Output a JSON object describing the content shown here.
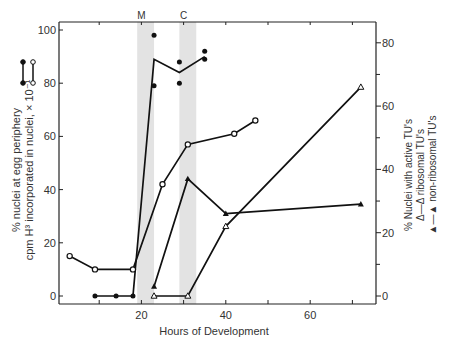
{
  "chart_data": {
    "type": "line",
    "title": "",
    "xlabel": "Hours of Development",
    "ylabel_left": [
      "% nuclei at egg periphery",
      "cpm H³ incorporated in nuclei, × 10⁻¹"
    ],
    "ylabel_right": [
      "% Nuclei with active TU's",
      "Δ—Δ ribosomal TU's",
      "▲—▲ non-ribosomal TU's"
    ],
    "xlim": [
      0,
      75
    ],
    "ylim_left": [
      0,
      100
    ],
    "ylim_right": [
      0,
      85
    ],
    "x_ticks": [
      20,
      40,
      60
    ],
    "y_ticks_left": [
      0,
      20,
      40,
      60,
      80,
      100
    ],
    "y_ticks_right": [
      0,
      20,
      40,
      60,
      80
    ],
    "grid": false,
    "annotations": [
      {
        "label": "M",
        "x": 20,
        "band": [
          19,
          23
        ]
      },
      {
        "label": "C",
        "x": 30,
        "band": [
          29,
          33
        ]
      }
    ],
    "series": [
      {
        "name": "% nuclei at egg periphery",
        "marker": "filled-circle",
        "axis": "left",
        "x": [
          9,
          14,
          18,
          23,
          29,
          35
        ],
        "values": [
          0,
          0,
          0,
          89,
          84,
          90
        ],
        "scatter_points": [
          [
            23,
            98
          ],
          [
            23,
            79
          ],
          [
            29,
            88
          ],
          [
            29,
            80
          ],
          [
            35,
            92
          ],
          [
            35,
            89
          ]
        ]
      },
      {
        "name": "cpm H³ incorporated in nuclei, × 10⁻¹",
        "marker": "open-circle",
        "axis": "left",
        "x": [
          3,
          9,
          18,
          25,
          31,
          42,
          47
        ],
        "values": [
          15,
          10,
          10,
          42,
          57,
          61,
          66
        ]
      },
      {
        "name": "ribosomal TU's",
        "marker": "open-triangle",
        "axis": "right",
        "x": [
          23,
          31,
          40,
          72
        ],
        "values": [
          0,
          0,
          22,
          66
        ]
      },
      {
        "name": "non-ribosomal TU's",
        "marker": "filled-triangle",
        "axis": "right",
        "x": [
          23,
          31,
          40,
          72
        ],
        "values": [
          3,
          37,
          26,
          29
        ]
      }
    ]
  }
}
